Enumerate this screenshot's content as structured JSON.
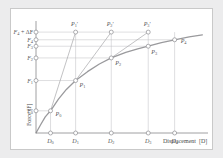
{
  "figure": {
    "type": "force-displacement-curve-diagram",
    "background_color": "#ececed",
    "plot_background_color": "#ffffff",
    "curve_color": "#9a9a9d",
    "line_color": "#a8a8ab",
    "marker_color": "#8d8d90",
    "text_color": "#57575a"
  },
  "axes": {
    "x_title": "Displacement",
    "x_title_symbol": "(D)",
    "y_title": "Force",
    "y_title_symbol": "(F)"
  },
  "y_ticks": [
    {
      "id": "y5",
      "label": "F",
      "sub": "4",
      "suffix": " + ΔF",
      "value": 5.0
    },
    {
      "id": "y4",
      "label": "F",
      "sub": "4",
      "suffix": "",
      "value": 4.62
    },
    {
      "id": "y3",
      "label": "F",
      "sub": "3",
      "suffix": "",
      "value": 4.3
    },
    {
      "id": "y2",
      "label": "F",
      "sub": "2",
      "suffix": "",
      "value": 3.72
    },
    {
      "id": "y1",
      "label": "F",
      "sub": "1",
      "suffix": "",
      "value": 2.6
    },
    {
      "id": "y0",
      "label": "F",
      "sub": "0",
      "suffix": "",
      "value": 1.1
    }
  ],
  "x_ticks": [
    {
      "id": "x0",
      "label": "D",
      "sub": "0",
      "value": 0.55
    },
    {
      "id": "x1",
      "label": "D",
      "sub": "1",
      "value": 1.5
    },
    {
      "id": "x2",
      "label": "D",
      "sub": "2",
      "value": 2.85
    },
    {
      "id": "x3",
      "label": "D",
      "sub": "3",
      "value": 4.25
    },
    {
      "id": "x4",
      "label": "D",
      "sub": "4",
      "value": 5.25
    }
  ],
  "curve_points": [
    {
      "id": "P0",
      "label": "P",
      "sub": "0",
      "x": 0.55,
      "y": 1.1,
      "label_dx": 5,
      "label_dy": 5
    },
    {
      "id": "P1",
      "label": "P",
      "sub": "1",
      "x": 1.5,
      "y": 2.6,
      "label_dx": 4,
      "label_dy": 6
    },
    {
      "id": "P2",
      "label": "P",
      "sub": "2",
      "x": 2.85,
      "y": 3.72,
      "label_dx": 4,
      "label_dy": 7
    },
    {
      "id": "P3",
      "label": "P",
      "sub": "3",
      "x": 4.25,
      "y": 4.3,
      "label_dx": 3,
      "label_dy": 8
    },
    {
      "id": "P4",
      "label": "P",
      "sub": "4",
      "x": 5.25,
      "y": 4.62,
      "label_dx": 6,
      "label_dy": 3
    }
  ],
  "primed_points": [
    {
      "id": "P1p",
      "label": "P",
      "sub": "1",
      "prime": "′",
      "x": 1.5,
      "y": 5.0,
      "label_dx": -1,
      "label_dy": -6
    },
    {
      "id": "P2p",
      "label": "P",
      "sub": "2",
      "prime": "′",
      "x": 2.85,
      "y": 5.0,
      "label_dx": -1,
      "label_dy": -6
    },
    {
      "id": "P3p",
      "label": "P",
      "sub": "3",
      "prime": "′",
      "x": 4.25,
      "y": 5.0,
      "label_dx": -1,
      "label_dy": -6
    }
  ],
  "chart_data": {
    "type": "line",
    "title": "",
    "xlabel": "Displacement (D)",
    "ylabel": "Force (F)",
    "xlim": [
      0,
      6.4
    ],
    "ylim": [
      0,
      5.55
    ],
    "grid": false,
    "series": [
      {
        "name": "force-displacement curve",
        "x": [
          0,
          0.18,
          0.35,
          0.55,
          0.85,
          1.15,
          1.5,
          1.95,
          2.4,
          2.85,
          3.4,
          3.85,
          4.25,
          4.75,
          5.25,
          5.8,
          6.3
        ],
        "y": [
          0,
          0.42,
          0.8,
          1.1,
          1.68,
          2.16,
          2.6,
          3.04,
          3.42,
          3.72,
          4.0,
          4.17,
          4.3,
          4.48,
          4.62,
          4.76,
          4.86
        ]
      },
      {
        "name": "secant P0-P1prime",
        "x": [
          0.55,
          1.5
        ],
        "y": [
          1.1,
          5.0
        ]
      },
      {
        "name": "secant P1-P2prime",
        "x": [
          1.5,
          2.85
        ],
        "y": [
          2.6,
          5.0
        ]
      },
      {
        "name": "secant P2-P3prime",
        "x": [
          2.85,
          4.25
        ],
        "y": [
          3.72,
          5.0
        ]
      }
    ],
    "annotations": [
      "F4 + ΔF",
      "F4",
      "F3",
      "F2",
      "F1",
      "F0",
      "D0",
      "D1",
      "D2",
      "D3",
      "D4",
      "P0",
      "P1",
      "P2",
      "P3",
      "P4",
      "P1′",
      "P2′",
      "P3′"
    ]
  }
}
